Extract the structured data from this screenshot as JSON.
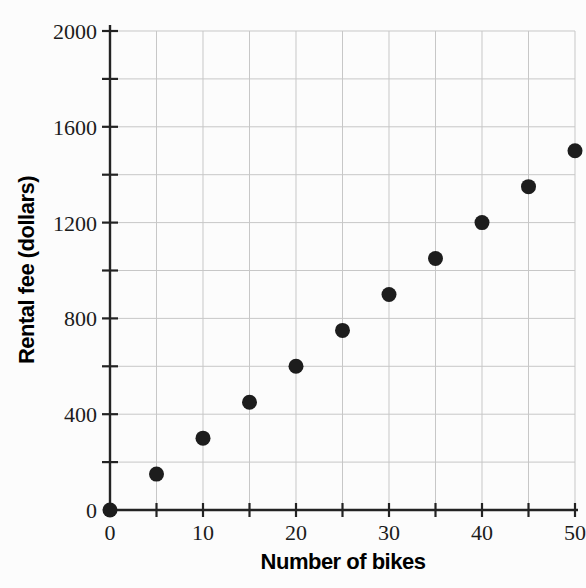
{
  "chart_data": {
    "type": "scatter",
    "title": "",
    "xlabel": "Number of bikes",
    "ylabel": "Rental fee (dollars)",
    "x": [
      0,
      5,
      10,
      15,
      20,
      25,
      30,
      35,
      40,
      45,
      50
    ],
    "y": [
      0,
      150,
      300,
      450,
      600,
      750,
      900,
      1050,
      1200,
      1350,
      1500
    ],
    "xlim": [
      0,
      50
    ],
    "ylim": [
      0,
      2000
    ],
    "xticks_labeled": [
      0,
      10,
      20,
      30,
      40,
      50
    ],
    "yticks_labeled": [
      0,
      400,
      800,
      1200,
      1600,
      2000
    ],
    "x_minor_step": 5,
    "y_minor_step": 200,
    "grid": "on",
    "legend": "none",
    "marker": "filled-circle",
    "colors": {
      "background": "#fcfcfc",
      "grid": "#c7c7c7",
      "axis": "#232323",
      "point": "#1d1d1d",
      "text": "#1b1b1b"
    }
  }
}
